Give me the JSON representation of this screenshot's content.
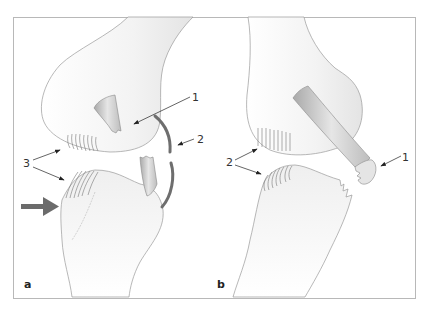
{
  "figure": {
    "panels": [
      {
        "id": "a",
        "label": "a",
        "callouts": [
          {
            "number": "1",
            "structure": "torn ligament stump (femoral attachment)"
          },
          {
            "number": "2",
            "structure": "lateral capsule/ligament rupture (curved band)"
          },
          {
            "number": "3",
            "structure": "articular cartilage contact zones"
          }
        ],
        "force_arrow": "valgus force from lateral side"
      },
      {
        "id": "b",
        "label": "b",
        "callouts": [
          {
            "number": "1",
            "structure": "avulsed ligament with bone fragment"
          },
          {
            "number": "2",
            "structure": "articular cartilage contact zones"
          }
        ]
      }
    ],
    "colors": {
      "frame": "#b8b8b8",
      "outline": "#9a9a9a",
      "bone_shade": "#ececec",
      "ligament": "#cfcfcf",
      "ligament_band": "#6e6e6e",
      "force_arrow": "#6b6b6b",
      "leader": "#333333"
    }
  },
  "labels": {
    "a_1": "1",
    "a_2": "2",
    "a_3": "3",
    "a_panel": "a",
    "b_1": "1",
    "b_2": "2",
    "b_panel": "b"
  }
}
